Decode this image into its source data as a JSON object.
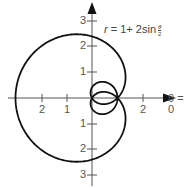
{
  "chart_data": {
    "type": "line",
    "subtype": "polar",
    "title": "",
    "equation": {
      "lhs": "r",
      "equals": "=",
      "rhs_prefix": "1+ 2sin",
      "frac_num": "θ",
      "frac_den": "2"
    },
    "function": "r = 1 + 2 sin(θ/2)",
    "theta_range": [
      0,
      12.566
    ],
    "polar_axis_label": "θ = 0",
    "x_ticks": [
      {
        "value": -2,
        "label": "2"
      },
      {
        "value": -1,
        "label": "1"
      },
      {
        "value": 2,
        "label": "2"
      }
    ],
    "y_ticks": [
      {
        "value": 3,
        "label": "3"
      },
      {
        "value": 2,
        "label": "2"
      },
      {
        "value": 1,
        "label": "1"
      },
      {
        "value": -1,
        "label": "1"
      },
      {
        "value": -2,
        "label": "2"
      },
      {
        "value": -3,
        "label": "3"
      }
    ],
    "key_points": [
      {
        "theta": "0",
        "r": 1,
        "x": 1,
        "y": 0
      },
      {
        "theta": "π/2",
        "r": 2.414,
        "x": 0,
        "y": 2.414
      },
      {
        "theta": "π",
        "r": 3,
        "x": -3,
        "y": 0
      },
      {
        "theta": "3π/2",
        "r": 2.414,
        "x": 0,
        "y": -2.414
      },
      {
        "theta": "2π",
        "r": 1,
        "x": 1,
        "y": 0
      },
      {
        "theta": "3π",
        "r": -1,
        "x": 1,
        "y": 0
      },
      {
        "theta": "4π",
        "r": 1,
        "x": 1,
        "y": 0
      }
    ],
    "grid": false,
    "legend": "none",
    "colors": {
      "curve": "#111111",
      "axes": "#555555",
      "text": "#555555"
    }
  },
  "labels": {
    "x_tick_neg2": "2",
    "x_tick_neg1": "1",
    "x_tick_pos2": "2",
    "y_tick_pos3": "3",
    "y_tick_pos2": "2",
    "y_tick_pos1": "1",
    "y_tick_neg1": "1",
    "y_tick_neg2": "2",
    "y_tick_neg3": "3",
    "polar_axis": "θ = 0"
  }
}
